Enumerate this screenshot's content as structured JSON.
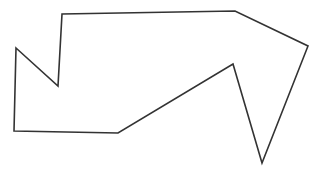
{
  "canvas": {
    "width": 323,
    "height": 173,
    "background_color": "#ffffff",
    "description": "Hand-drawn closed polygon outline"
  },
  "shape": {
    "name": "irregular-polygon",
    "stroke_color": "#333333",
    "fill_color": "none",
    "stroke_width": 1.6,
    "closed": true,
    "vertex_count": 10,
    "vertices": [
      {
        "label": "left-upper-peak",
        "x": 16,
        "y": 48
      },
      {
        "label": "notch-bottom",
        "x": 58,
        "y": 86
      },
      {
        "label": "notch-top",
        "x": 62,
        "y": 14
      },
      {
        "label": "top-right-bend",
        "x": 235,
        "y": 11
      },
      {
        "label": "right-outer-corner",
        "x": 308,
        "y": 46
      },
      {
        "label": "bottom-spike-tip",
        "x": 262,
        "y": 163
      },
      {
        "label": "inner-peak",
        "x": 233,
        "y": 64
      },
      {
        "label": "lower-diagonal-corner",
        "x": 118,
        "y": 133
      },
      {
        "label": "bottom-left-corner",
        "x": 14,
        "y": 131
      },
      {
        "label": "close-to-start",
        "x": 16,
        "y": 48
      }
    ],
    "path_d": "M 16 48 L 58 86 L 62 14 L 235 11 L 308 46 L 262 163 L 233 64 L 118 133 L 14 131 Z"
  }
}
